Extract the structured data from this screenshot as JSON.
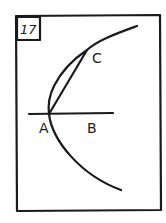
{
  "figure": {
    "number": "17",
    "points": [
      {
        "id": "A",
        "label": "A"
      },
      {
        "id": "B",
        "label": "B"
      },
      {
        "id": "C",
        "label": "C"
      }
    ],
    "elements": [
      {
        "type": "line",
        "from": "A",
        "to": "B",
        "description": "horizontal line through A and B"
      },
      {
        "type": "segment",
        "from": "A",
        "to": "C"
      },
      {
        "type": "arc",
        "description": "arc passing through C and A, extending below A"
      }
    ],
    "ink_color": "#1a1a1a",
    "background": "#ffffff"
  }
}
